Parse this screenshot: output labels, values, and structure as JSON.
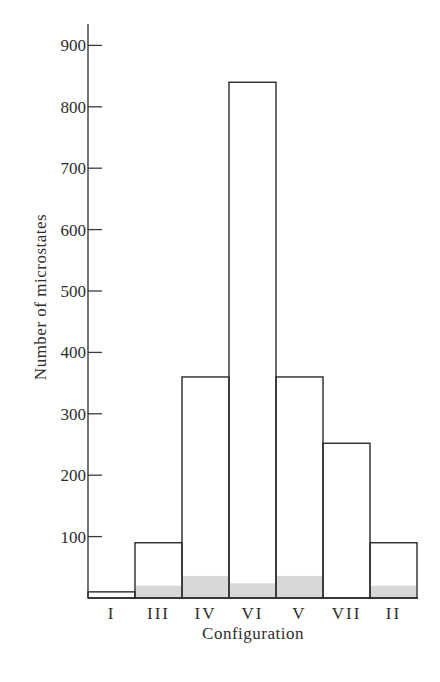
{
  "chart_data": {
    "type": "bar",
    "title": "",
    "xlabel": "Configuration",
    "ylabel": "Number of microstates",
    "categories": [
      "I",
      "III",
      "IV",
      "VI",
      "V",
      "VII",
      "II"
    ],
    "values": [
      10,
      90,
      360,
      840,
      360,
      252,
      90
    ],
    "shaded_base_values": [
      0,
      20,
      36,
      24,
      36,
      0,
      20
    ],
    "ylim": [
      0,
      900
    ],
    "yticks": [
      100,
      200,
      300,
      400,
      500,
      600,
      700,
      800,
      900
    ],
    "grid": false,
    "legend": null,
    "colors": {
      "bar_fill": "#ffffff",
      "bar_stroke": "#2a2a2a",
      "shade_fill": "#d8d8d8",
      "axis": "#3a3a3a"
    }
  }
}
